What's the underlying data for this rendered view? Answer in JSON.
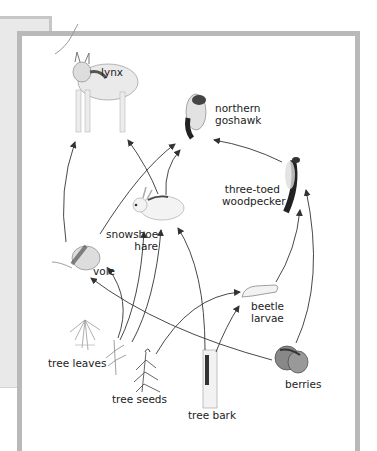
{
  "diagram": {
    "type": "food-web",
    "organisms": [
      {
        "id": "lynx",
        "lines": [
          "lynx"
        ],
        "role": "predator"
      },
      {
        "id": "northern-goshawk",
        "lines": [
          "northern",
          "goshawk"
        ],
        "role": "predator"
      },
      {
        "id": "three-toed-woodpecker",
        "lines": [
          "three-toed",
          "woodpecker"
        ],
        "role": "consumer"
      },
      {
        "id": "snowshoe-hare",
        "lines": [
          "snowshoe",
          "hare"
        ],
        "role": "herbivore"
      },
      {
        "id": "vole",
        "lines": [
          "vole"
        ],
        "role": "herbivore"
      },
      {
        "id": "beetle-larvae",
        "lines": [
          "beetle",
          "larvae"
        ],
        "role": "consumer"
      },
      {
        "id": "tree-leaves",
        "lines": [
          "tree leaves"
        ],
        "role": "producer"
      },
      {
        "id": "tree-seeds",
        "lines": [
          "tree seeds"
        ],
        "role": "producer"
      },
      {
        "id": "tree-bark",
        "lines": [
          "tree bark"
        ],
        "role": "producer"
      },
      {
        "id": "berries",
        "lines": [
          "berries"
        ],
        "role": "producer"
      }
    ],
    "edges": [
      {
        "from": "vole",
        "to": "lynx"
      },
      {
        "from": "snowshoe-hare",
        "to": "lynx"
      },
      {
        "from": "vole",
        "to": "northern-goshawk"
      },
      {
        "from": "snowshoe-hare",
        "to": "northern-goshawk"
      },
      {
        "from": "three-toed-woodpecker",
        "to": "northern-goshawk"
      },
      {
        "from": "beetle-larvae",
        "to": "three-toed-woodpecker"
      },
      {
        "from": "berries",
        "to": "three-toed-woodpecker"
      },
      {
        "from": "tree-leaves",
        "to": "vole"
      },
      {
        "from": "berries",
        "to": "vole"
      },
      {
        "from": "tree-leaves",
        "to": "snowshoe-hare"
      },
      {
        "from": "tree-seeds",
        "to": "snowshoe-hare"
      },
      {
        "from": "tree-bark",
        "to": "snowshoe-hare"
      },
      {
        "from": "tree-seeds",
        "to": "beetle-larvae"
      },
      {
        "from": "tree-bark",
        "to": "beetle-larvae"
      }
    ]
  },
  "labels": {
    "lynx": [
      "lynx"
    ],
    "goshawk": [
      "northern",
      "goshawk"
    ],
    "woodpecker": [
      "three-toed",
      "woodpecker"
    ],
    "hare": [
      "snowshoe",
      "hare"
    ],
    "vole": [
      "vole"
    ],
    "beetle": [
      "beetle",
      "larvae"
    ],
    "leaves": [
      "tree leaves"
    ],
    "seeds": [
      "tree seeds"
    ],
    "bark": [
      "tree bark"
    ],
    "berries": [
      "berries"
    ]
  },
  "colors": {
    "frame_border": "#b9b9b9",
    "back_panel": "#e9e9e9",
    "arrow": "#333333",
    "text": "#222222"
  }
}
